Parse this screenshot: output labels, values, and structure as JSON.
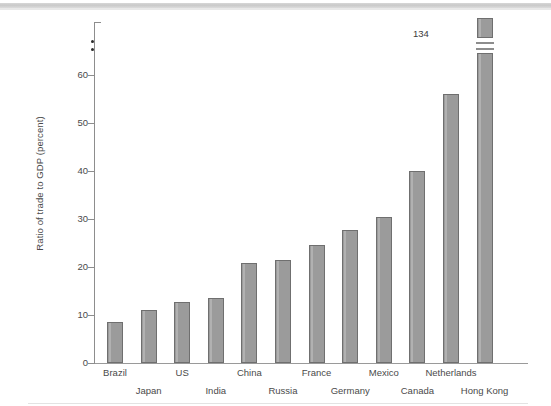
{
  "chart_data": {
    "type": "bar",
    "title": "",
    "subtitle": "",
    "xlabel": "",
    "ylabel": "Ratio of trade to GDP (percent)",
    "categories": [
      "Brazil",
      "Japan",
      "US",
      "India",
      "China",
      "Russia",
      "France",
      "Germany",
      "Mexico",
      "Canada",
      "Netherlands",
      "Hong Kong"
    ],
    "values": [
      8.5,
      11.0,
      12.8,
      13.5,
      20.8,
      21.4,
      24.6,
      27.8,
      30.4,
      40.0,
      56.0,
      134.0
    ],
    "ylim": [
      0,
      65
    ],
    "yticks": [
      0,
      10,
      20,
      30,
      40,
      50,
      60
    ],
    "ytick_labels": [
      "0",
      "10",
      "20",
      "30",
      "40",
      "50",
      "60"
    ],
    "grid": false,
    "legend": "none",
    "axis_break": {
      "present": true,
      "axis": "y",
      "note": "y-axis broken above 60; Hong Kong bar truncated with break marks"
    },
    "annotations": [
      {
        "text": "134",
        "for": "Hong Kong",
        "kind": "value-label"
      }
    ],
    "series_color": "#9b9b9b",
    "series_edge_color": "#6f6f6f",
    "axis_color": "#8d8d8d",
    "text_color": "#4a4a4a",
    "background": "#ffffff"
  },
  "figure": {
    "ylabel": "Ratio of trade to GDP (percent)",
    "broken_value_label": "134",
    "x_labels_row_top": [
      "Brazil",
      "US",
      "China",
      "France",
      "Mexico",
      "Netherlands"
    ],
    "x_labels_row_bottom": [
      "Japan",
      "India",
      "Russia",
      "Germany",
      "Canada",
      "Hong Kong"
    ]
  }
}
